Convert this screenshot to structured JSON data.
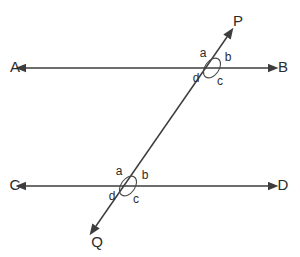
{
  "figure": {
    "background_color": "#ffffff",
    "stroke_color": "#3d3d3d",
    "label_color": "#2b2b2b",
    "width": 300,
    "height": 257
  },
  "lines": {
    "top_parallel": {
      "name": "AB",
      "y": 68,
      "x_start": 26,
      "x_end": 268,
      "left_label": "A",
      "right_label": "B",
      "left_label_x": 15,
      "left_label_y": 68,
      "right_label_x": 283,
      "right_label_y": 68
    },
    "bottom_parallel": {
      "name": "CD",
      "y": 186,
      "x_start": 26,
      "x_end": 268,
      "left_label": "C",
      "right_label": "D",
      "left_label_x": 15,
      "left_label_y": 186,
      "right_label_x": 283,
      "right_label_y": 186
    },
    "transversal": {
      "name": "PQ",
      "x_start": 96,
      "y_start": 226,
      "x_end": 227,
      "y_end": 37,
      "top_label": "P",
      "bottom_label": "Q",
      "top_label_x": 238,
      "top_label_y": 22,
      "bottom_label_x": 97,
      "bottom_label_y": 243
    }
  },
  "intersections": [
    {
      "id": "upper",
      "center_x": 212,
      "center_y": 68,
      "ellipse_rx": 11,
      "ellipse_ry": 7,
      "ellipse_rotation": -55,
      "angles": [
        {
          "key": "a",
          "label": "a",
          "x": 203,
          "y": 54
        },
        {
          "key": "b",
          "label": "b",
          "x": 228,
          "y": 58
        },
        {
          "key": "c",
          "label": "c",
          "x": 220,
          "y": 82
        },
        {
          "key": "d",
          "label": "d",
          "x": 196,
          "y": 79
        }
      ]
    },
    {
      "id": "lower",
      "center_x": 128,
      "center_y": 186,
      "ellipse_rx": 11,
      "ellipse_ry": 7,
      "ellipse_rotation": -55,
      "angles": [
        {
          "key": "a",
          "label": "a",
          "x": 119,
          "y": 172
        },
        {
          "key": "b",
          "label": "b",
          "x": 145,
          "y": 176
        },
        {
          "key": "c",
          "label": "c",
          "x": 136,
          "y": 200
        },
        {
          "key": "d",
          "label": "d",
          "x": 112,
          "y": 197
        }
      ]
    }
  ]
}
